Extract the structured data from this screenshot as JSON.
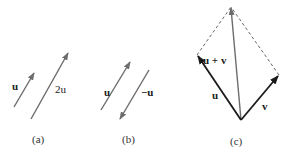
{
  "panels": [
    {
      "caption": "(a)",
      "vectors": [
        {
          "label": "u",
          "from": [
            14,
            107
          ],
          "to": [
            34,
            73
          ]
        },
        {
          "label": "2u",
          "from": [
            31,
            119
          ],
          "to": [
            68,
            53
          ]
        }
      ]
    },
    {
      "caption": "(b)",
      "vectors": [
        {
          "label": "u",
          "from": [
            101,
            110
          ],
          "to": [
            130,
            62
          ]
        },
        {
          "label": "−u",
          "from": [
            149,
            70
          ],
          "to": [
            120,
            119
          ]
        }
      ]
    },
    {
      "caption": "(c)",
      "vectors": [
        {
          "label": "u",
          "from": [
            241,
            120
          ],
          "to": [
            197,
            55
          ]
        },
        {
          "label": "v",
          "from": [
            241,
            120
          ],
          "to": [
            279,
            75
          ]
        },
        {
          "label": "u + v",
          "from": [
            241,
            120
          ],
          "to": [
            231,
            7
          ]
        }
      ]
    }
  ],
  "labels": {
    "a_u": "u",
    "a_2u": "2u",
    "b_u": "u",
    "b_neg_u": "−u",
    "c_u": "u",
    "c_v": "v",
    "c_sum": "u + v",
    "cap_a": "(a)",
    "cap_b": "(b)",
    "cap_c": "(c)"
  },
  "colors": {
    "gray_arrow": "#6b6b6b",
    "dark_arrow": "#1a1a1a",
    "dashed": "#555555"
  }
}
